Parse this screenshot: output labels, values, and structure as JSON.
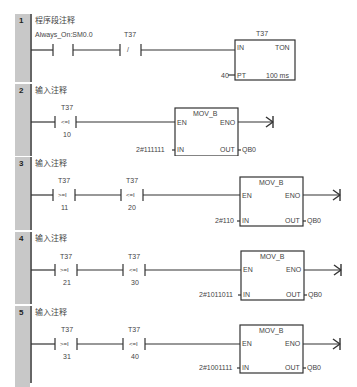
{
  "networks": [
    {
      "number": "1",
      "comment": "程序段注释",
      "contact1_label": "Always_On:SM0.0",
      "contact2_label": "T37",
      "contact2_symbol": "/",
      "timer": {
        "name": "T37",
        "type": "TON",
        "in": "IN",
        "pt": "PT",
        "pt_value": "40",
        "base": "100 ms"
      }
    },
    {
      "number": "2",
      "comment": "输入注释",
      "contact1_label": "T37",
      "contact1_op": "<=I",
      "contact1_value": "10",
      "block": {
        "name": "MOV_B",
        "en": "EN",
        "eno": "ENO",
        "in": "IN",
        "out": "OUT",
        "in_value": "2#111111",
        "out_value": "QB0"
      }
    },
    {
      "number": "3",
      "comment": "输入注释",
      "contact1_label": "T37",
      "contact1_op": ">=I",
      "contact1_value": "11",
      "contact2_label": "T37",
      "contact2_op": "<=I",
      "contact2_value": "20",
      "block": {
        "name": "MOV_B",
        "en": "EN",
        "eno": "ENO",
        "in": "IN",
        "out": "OUT",
        "in_value": "2#110",
        "out_value": "QB0"
      }
    },
    {
      "number": "4",
      "comment": "输入注释",
      "contact1_label": "T37",
      "contact1_op": ">=I",
      "contact1_value": "21",
      "contact2_label": "T37",
      "contact2_op": "<=I",
      "contact2_value": "30",
      "block": {
        "name": "MOV_B",
        "en": "EN",
        "eno": "ENO",
        "in": "IN",
        "out": "OUT",
        "in_value": "2#1011011",
        "out_value": "QB0"
      }
    },
    {
      "number": "5",
      "comment": "输入注释",
      "contact1_label": "T37",
      "contact1_op": ">=I",
      "contact1_value": "31",
      "contact2_label": "T37",
      "contact2_op": "<=I",
      "contact2_value": "40",
      "block": {
        "name": "MOV_B",
        "en": "EN",
        "eno": "ENO",
        "in": "IN",
        "out": "OUT",
        "in_value": "2#1001111",
        "out_value": "QB0"
      }
    }
  ],
  "colors": {
    "gutter": "#c8c8c8",
    "line": "#333333",
    "text": "#444444"
  }
}
